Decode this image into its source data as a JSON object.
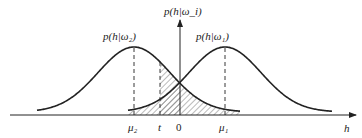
{
  "diagram": {
    "type": "overlapping-gaussian-class-densities",
    "y_axis_label": "p(h|ω_i)",
    "x_axis_label": "h",
    "curves": [
      {
        "name": "class-2",
        "label": "p(h|ω₂)",
        "mean_label": "μ₂"
      },
      {
        "name": "class-1",
        "label": "p(h|ω₁)",
        "mean_label": "μ₁"
      }
    ],
    "x_ticks": [
      "μ₂",
      "t",
      "0",
      "μ₁"
    ],
    "threshold_label": "t",
    "origin_label": "0",
    "hatched_regions": [
      "tail of p(h|ω₁) left of the axis",
      "tail of p(h|ω₂) right of threshold t"
    ],
    "colors": {
      "stroke": "#222222",
      "hatch": "#555555",
      "background": "#ffffff"
    }
  }
}
